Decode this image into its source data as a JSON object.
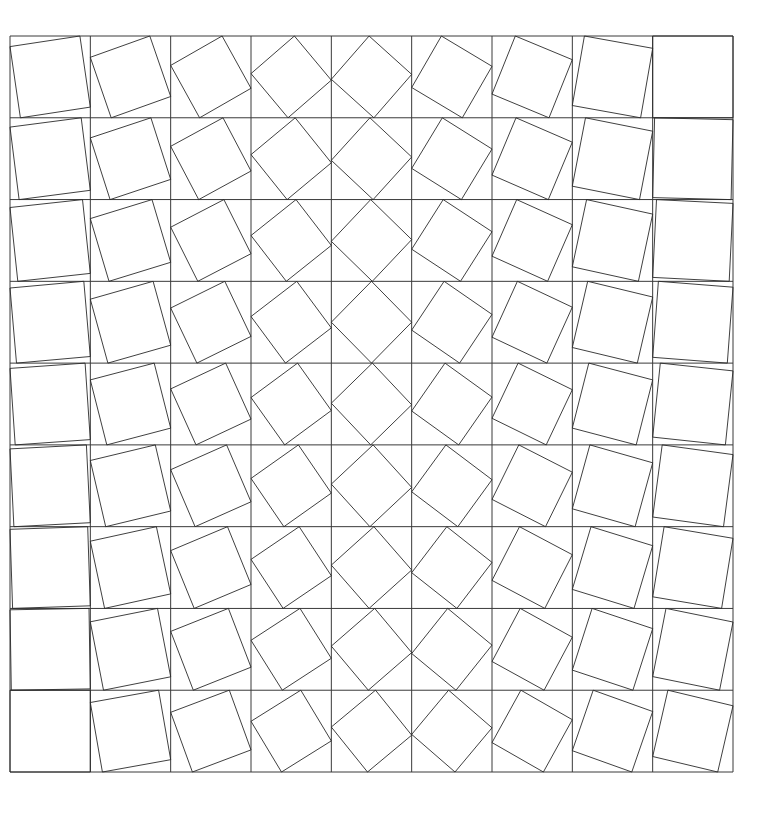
{
  "diagram": {
    "type": "rotated-square-grid",
    "rows": 9,
    "cols": 9,
    "grid": {
      "x0": 10,
      "y0": 36,
      "x1": 733,
      "y1": 772
    },
    "colors": {
      "stroke": "#2a2a2a",
      "grid": "#3a3a3a",
      "background": "#ffffff"
    },
    "rotation_offsets_row_first": [
      0.87,
      0.74,
      0.64,
      0.54,
      0.47,
      0.37,
      0.29,
      0.15,
      0.0
    ],
    "rotation_offsets_row_last": [
      1.0,
      0.85,
      0.73,
      0.62,
      0.55,
      0.46,
      0.36,
      0.26,
      0.19
    ]
  }
}
